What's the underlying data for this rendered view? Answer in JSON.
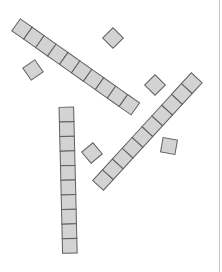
{
  "diagram": {
    "type": "base-ten-blocks",
    "cell_size": 14.6,
    "colors": {
      "fill": "#d3d3d3",
      "stroke": "#5f5f5f",
      "border": "#c4c4c4"
    },
    "rods": [
      {
        "id": "rod-a",
        "units": 10,
        "start_center": [
          22,
          29
        ],
        "angle_deg": 35.2
      },
      {
        "id": "rod-b",
        "units": 10,
        "start_center": [
          103,
          180
        ],
        "angle_deg": -47.5
      },
      {
        "id": "rod-c",
        "units": 10,
        "start_center": [
          66.5,
          114.5
        ],
        "angle_deg": 88.6
      }
    ],
    "units": [
      {
        "id": "unit-1",
        "center": [
          113,
          38
        ],
        "angle_deg": 45
      },
      {
        "id": "unit-2",
        "center": [
          33,
          70
        ],
        "angle_deg": -35
      },
      {
        "id": "unit-3",
        "center": [
          155,
          85
        ],
        "angle_deg": 45
      },
      {
        "id": "unit-4",
        "center": [
          92,
          153
        ],
        "angle_deg": -40
      },
      {
        "id": "unit-5",
        "center": [
          169,
          146
        ],
        "angle_deg": 10
      }
    ],
    "summary": {
      "tens": 3,
      "ones": 5,
      "total": 35
    }
  }
}
